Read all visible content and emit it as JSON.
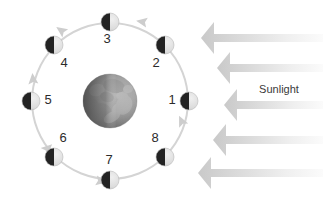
{
  "diagram": {
    "background_color": "#ffffff",
    "width": 323,
    "height": 205
  },
  "center_body": {
    "name": "Earth",
    "cx": 110,
    "cy": 101,
    "r": 27,
    "lit_color": "#9a9a9a",
    "dark_color": "#5a5a5a"
  },
  "orbit": {
    "cx": 110,
    "cy": 101,
    "r": 78,
    "stroke_color": "#d4d4d4",
    "stroke_width": 2,
    "direction": "counterclockwise"
  },
  "moon_positions": [
    {
      "label": "1",
      "angle_deg": 0,
      "moon_cx": 189,
      "moon_cy": 101,
      "num_x": 172,
      "num_y": 101,
      "r": 9
    },
    {
      "label": "2",
      "angle_deg": 45,
      "moon_cx": 165,
      "moon_cy": 45,
      "num_x": 156,
      "num_y": 64,
      "r": 9
    },
    {
      "label": "3",
      "angle_deg": 90,
      "moon_cx": 110,
      "moon_cy": 22,
      "num_x": 107,
      "num_y": 40,
      "r": 9
    },
    {
      "label": "4",
      "angle_deg": 135,
      "moon_cx": 54,
      "moon_cy": 45,
      "num_x": 64,
      "num_y": 64,
      "r": 9
    },
    {
      "label": "5",
      "angle_deg": 180,
      "moon_cx": 31,
      "moon_cy": 101,
      "num_x": 48,
      "num_y": 101,
      "r": 9
    },
    {
      "label": "6",
      "angle_deg": 225,
      "moon_cx": 54,
      "moon_cy": 157,
      "num_x": 63,
      "num_y": 139,
      "r": 9
    },
    {
      "label": "7",
      "angle_deg": 270,
      "moon_cx": 110,
      "moon_cy": 180,
      "num_x": 109,
      "num_y": 161,
      "r": 9
    },
    {
      "label": "8",
      "angle_deg": 315,
      "moon_cx": 165,
      "moon_cy": 157,
      "num_x": 155,
      "num_y": 139,
      "r": 9
    }
  ],
  "moon_style": {
    "lit_color": "#e0e0e0",
    "dark_color": "#232323",
    "lit_side": "right",
    "terminator_color": "#b5b5b5"
  },
  "orbit_arrows": [
    {
      "name": "orbit-arrow-top-left",
      "x": 62,
      "y": 31,
      "rotate": 215
    },
    {
      "name": "orbit-arrow-left",
      "x": 33,
      "y": 80,
      "rotate": 265
    },
    {
      "name": "orbit-arrow-bottom-left",
      "x": 47,
      "y": 149,
      "rotate": 317
    },
    {
      "name": "orbit-arrow-bottom",
      "x": 100,
      "y": 181,
      "rotate": 10
    },
    {
      "name": "orbit-arrow-right",
      "x": 182,
      "y": 122,
      "rotate": 245
    },
    {
      "name": "orbit-arrow-top-right",
      "x": 143,
      "y": 22,
      "rotate": 190
    }
  ],
  "sunlight": {
    "label": "Sunlight",
    "label_x": 279,
    "label_y": 90,
    "direction": "right-to-left",
    "arrow_color_dark": "#cfcfcf",
    "arrow_color_light": "#f3f3f3",
    "arrows": [
      {
        "tip_x": 201,
        "tail_x": 323,
        "y": 38,
        "thickness": 8
      },
      {
        "tip_x": 217,
        "tail_x": 323,
        "y": 68,
        "thickness": 8
      },
      {
        "tip_x": 224,
        "tail_x": 323,
        "y": 105,
        "thickness": 8
      },
      {
        "tip_x": 213,
        "tail_x": 323,
        "y": 140,
        "thickness": 8
      },
      {
        "tip_x": 198,
        "tail_x": 323,
        "y": 173,
        "thickness": 8
      }
    ]
  }
}
